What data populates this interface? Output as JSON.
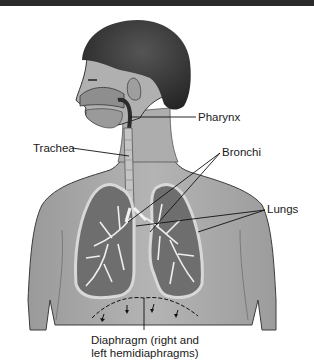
{
  "diagram": {
    "colors": {
      "top_bar": "#2a2a2a",
      "skin": "#a8a8a8",
      "hair": "#3a3a3a",
      "lung_fill": "#6e6e6e",
      "bronchi": "#f0f0f0",
      "leader_line": "#111111"
    },
    "labels": {
      "pharynx": "Pharynx",
      "trachea": "Trachea",
      "bronchi": "Bronchi",
      "lungs": "Lungs",
      "diaphragm_line1": "Diaphragm (right and",
      "diaphragm_line2": "left hemidiaphragms)"
    }
  }
}
